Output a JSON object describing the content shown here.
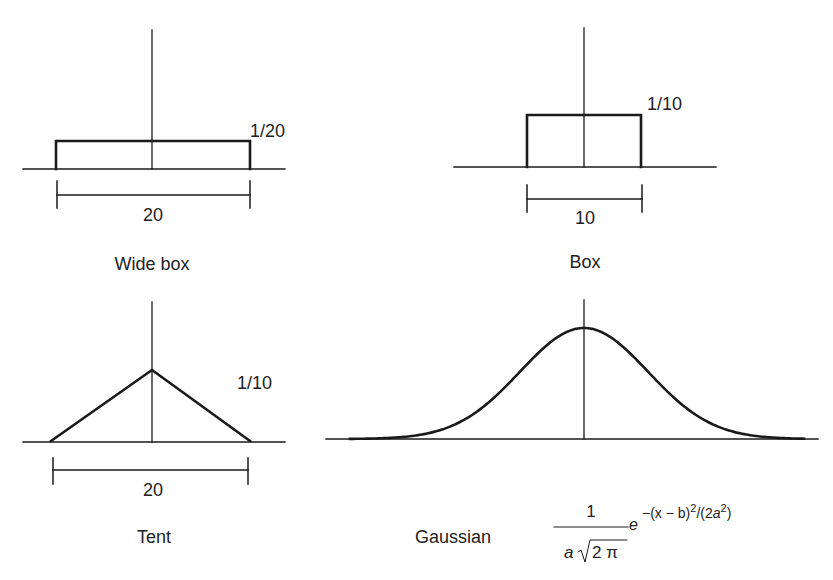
{
  "panels": {
    "wide_box": {
      "title": "Wide box",
      "height_label": "1/20",
      "width_label": "20"
    },
    "box": {
      "title": "Box",
      "height_label": "1/10",
      "width_label": "10"
    },
    "tent": {
      "title": "Tent",
      "height_label": "1/10",
      "width_label": "20"
    },
    "gaussian": {
      "title": "Gaussian",
      "formula": {
        "numerator": "1",
        "denominator_a": "a",
        "denominator_root": "2 π",
        "base": "e",
        "exponent_text": "−(x − b)",
        "exponent_sq": "2",
        "exponent_div": "/(2",
        "exponent_a": "a",
        "exponent_sq2": "2",
        "exponent_close": ")"
      }
    }
  },
  "colors": {
    "stroke": "#1a1a1a",
    "background": "#ffffff"
  },
  "chart_data": [
    {
      "type": "line",
      "title": "Wide box",
      "shape": "box",
      "width": 20,
      "height": "1/20",
      "x": [
        -10,
        -10,
        10,
        10
      ],
      "y": [
        0,
        0.05,
        0.05,
        0
      ]
    },
    {
      "type": "line",
      "title": "Box",
      "shape": "box",
      "width": 10,
      "height": "1/10",
      "x": [
        -5,
        -5,
        5,
        5
      ],
      "y": [
        0,
        0.1,
        0.1,
        0
      ]
    },
    {
      "type": "line",
      "title": "Tent",
      "shape": "triangle",
      "width": 20,
      "height": "1/10",
      "x": [
        -10,
        0,
        10
      ],
      "y": [
        0,
        0.1,
        0
      ]
    },
    {
      "type": "line",
      "title": "Gaussian",
      "shape": "gaussian",
      "formula": "1/(a√(2π)) e^(−(x − b)²/(2a²))"
    }
  ]
}
